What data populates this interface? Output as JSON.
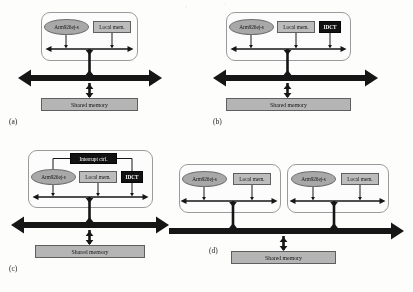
{
  "figure": {
    "colors": {
      "core_fill": "#a8a8a8",
      "local_mem_fill": "#bdbdbd",
      "shared_mem_fill": "#b5b5b5",
      "accelerator_fill": "#0d0d0d",
      "accelerator_text": "#ffffff",
      "bus_color": "#111111",
      "container_border": "#9a9a9a"
    },
    "labels": {
      "core": "Arm926ej-s",
      "local_mem": "Local mem.",
      "idct": "IDCT",
      "interrupt_ctrl": "Interrupt ctrl.",
      "shared_mem": "Shared memory"
    }
  },
  "panels": [
    {
      "id": "a",
      "caption": "(a)",
      "blocks": [
        "Arm926ej-s",
        "Local mem."
      ],
      "shared_memory": "Shared memory",
      "has_idct": false,
      "has_interrupt_ctrl": false,
      "subsystem_count": 1
    },
    {
      "id": "b",
      "caption": "(b)",
      "blocks": [
        "Arm926ej-s",
        "Local mem.",
        "IDCT"
      ],
      "shared_memory": "Shared memory",
      "has_idct": true,
      "has_interrupt_ctrl": false,
      "subsystem_count": 1
    },
    {
      "id": "c",
      "caption": "(c)",
      "blocks": [
        "Interrupt ctrl.",
        "Arm926ej-s",
        "Local mem.",
        "IDCT"
      ],
      "shared_memory": "Shared memory",
      "has_idct": true,
      "has_interrupt_ctrl": true,
      "subsystem_count": 1
    },
    {
      "id": "d",
      "caption": "(d)",
      "blocks": [
        "Arm926ej-s",
        "Local mem.",
        "Arm926ej-s",
        "Local mem."
      ],
      "shared_memory": "Shared memory",
      "has_idct": false,
      "has_interrupt_ctrl": false,
      "subsystem_count": 2
    }
  ]
}
